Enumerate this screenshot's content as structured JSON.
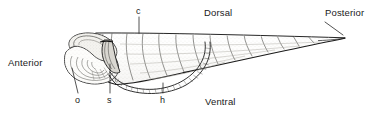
{
  "figure": {
    "type": "scientific-line-drawing",
    "background_color": "#ffffff",
    "ink_color": "#1a1a1a",
    "width": 379,
    "height": 118
  },
  "orientation_labels": {
    "anterior": "Anterior",
    "posterior": "Posterior",
    "dorsal": "Dorsal",
    "ventral": "Ventral"
  },
  "part_labels": {
    "c": "c",
    "o": "o",
    "s": "s",
    "h": "h"
  },
  "leader_lines": [
    {
      "name": "c-leader",
      "x1": 139,
      "y1": 16,
      "x2": 139,
      "y2": 33
    },
    {
      "name": "o-leader",
      "x1": 78,
      "y1": 94,
      "x2": 72,
      "y2": 68
    },
    {
      "name": "s-leader",
      "x1": 110,
      "y1": 94,
      "x2": 110,
      "y2": 64
    },
    {
      "name": "h-leader",
      "x1": 163,
      "y1": 94,
      "x2": 163,
      "y2": 83
    },
    {
      "name": "posterior-leader",
      "x1": 324,
      "y1": 22,
      "x2": 342,
      "y2": 34
    }
  ],
  "colors": {
    "ink": "#1a1a1a",
    "shade": "#8a8a8a",
    "fill": "#f7f6f2",
    "paper": "#ffffff"
  }
}
